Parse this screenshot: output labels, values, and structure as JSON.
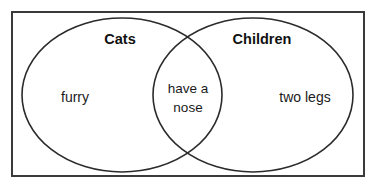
{
  "diagram": {
    "type": "venn",
    "title": "",
    "background_color": "#ffffff",
    "frame": {
      "stroke_color": "#3a3a3a",
      "x": 11,
      "y": 11,
      "width": 354,
      "height": 166
    },
    "sets": [
      {
        "name": "cats",
        "label": "Cats",
        "label_x": 120,
        "label_y": 44,
        "stroke_color": "#2b2b2b",
        "cx": 122,
        "cy": 95,
        "rx": 100,
        "ry": 77,
        "items": [
          {
            "text": "furry",
            "x": 75,
            "y": 102
          }
        ]
      },
      {
        "name": "children",
        "label": "Children",
        "label_x": 262,
        "label_y": 44,
        "stroke_color": "#2b2b2b",
        "cx": 253,
        "cy": 95,
        "rx": 100,
        "ry": 77,
        "items": [
          {
            "text": "two legs",
            "x": 305,
            "y": 102
          }
        ]
      }
    ],
    "intersection": {
      "name": "cats-and-children",
      "x": 188,
      "lines": [
        {
          "text": "have a",
          "y": 93
        },
        {
          "text": "nose",
          "y": 112
        }
      ]
    }
  }
}
